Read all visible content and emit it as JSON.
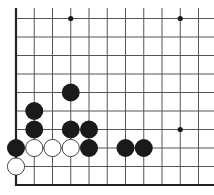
{
  "board": {
    "description": "Go board diagram, lower-left corner region",
    "origin_px": [
      16,
      185
    ],
    "col_spacing_px": 18.25,
    "row_spacing_px": 18.5,
    "cols": 11,
    "rows": 10,
    "edges": {
      "left": true,
      "bottom": true,
      "top": false,
      "right": false
    },
    "colors": {
      "background": "#ffffff",
      "grid": "#555555",
      "edge": "#222222",
      "black_stone": "#1a1a1a",
      "white_stone": "#ffffff",
      "white_stone_outline": "#333333"
    },
    "star_points": [
      {
        "col": 3,
        "row": 9
      },
      {
        "col": 9,
        "row": 9
      },
      {
        "col": 9,
        "row": 3
      }
    ],
    "stones": [
      {
        "color": "white",
        "col": 0,
        "row": 1
      },
      {
        "color": "black",
        "col": 0,
        "row": 2
      },
      {
        "color": "white",
        "col": 1,
        "row": 2
      },
      {
        "color": "white",
        "col": 2,
        "row": 2
      },
      {
        "color": "white",
        "col": 3,
        "row": 2
      },
      {
        "color": "black",
        "col": 4,
        "row": 2
      },
      {
        "color": "black",
        "col": 6,
        "row": 2
      },
      {
        "color": "black",
        "col": 7,
        "row": 2
      },
      {
        "color": "black",
        "col": 1,
        "row": 3
      },
      {
        "color": "black",
        "col": 3,
        "row": 3
      },
      {
        "color": "black",
        "col": 4,
        "row": 3
      },
      {
        "color": "black",
        "col": 1,
        "row": 4
      },
      {
        "color": "black",
        "col": 3,
        "row": 5
      }
    ]
  }
}
